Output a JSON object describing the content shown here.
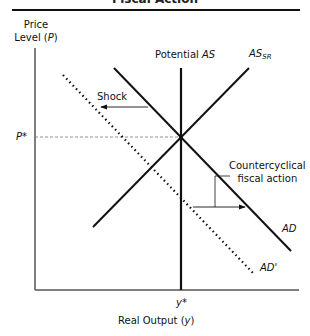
{
  "title": "Fiscal Action",
  "axes": {
    "y_label_line1": "Price",
    "y_label_line2": "Level (",
    "y_label_var": "P",
    "y_label_close": ")",
    "x_label_text": "Real Output (",
    "x_label_var": "y",
    "x_label_close": ")",
    "p_star": "P*",
    "y_star": "y*"
  },
  "curves": {
    "potential_as_text": "Potential ",
    "potential_as_var": "AS",
    "as_sr_main": "AS",
    "as_sr_sub": "SR",
    "ad": "AD",
    "ad_prime": "AD'"
  },
  "annotations": {
    "shock": "Shock",
    "countercyclical_line1": "Countercyclical",
    "countercyclical_line2": "fiscal action"
  },
  "colors": {
    "line": "#111111",
    "dashed": "#777777"
  }
}
